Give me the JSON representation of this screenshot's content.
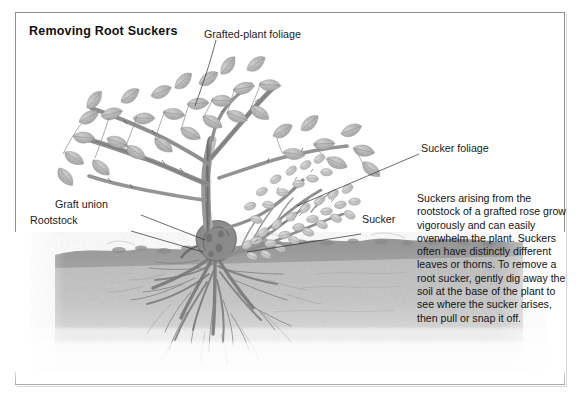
{
  "figure": {
    "title": "Removing Root Suckers",
    "kind": "botanical-instructional-illustration",
    "frame_color": "#8d8f92",
    "background_color": "#ffffff",
    "ink_color": "#1b1b1b"
  },
  "labels": {
    "grafted_foliage": "Grafted-plant foliage",
    "sucker_foliage": "Sucker foliage",
    "graft_union": "Graft union",
    "rootstock": "Rootstock",
    "sucker": "Sucker"
  },
  "body_text": {
    "paragraph": "Suckers arising from the rootstock of a grafted rose grow vigorously and can easily overwhelm the plant. Suckers often have distinctly different leaves or thorns. To remove a root sucker, gently dig away the soil at the base of the plant to see where the sucker arises, then pull or snap it off."
  },
  "illustration": {
    "soil_top_y": 248,
    "soil_fill_light": "#c9c9c9",
    "soil_fill_dark": "#8f8f8f",
    "plant_ink": "#6f6f6f",
    "leaf_fill": "#b9b9b9",
    "root_ink": "#7a7a7a",
    "parts": [
      "grafted-plant canes with broad oval leaflets",
      "sucker shoots with small rounded leaflets",
      "graft union at the crown",
      "rootstock below the graft union",
      "spreading root system in soil"
    ]
  }
}
